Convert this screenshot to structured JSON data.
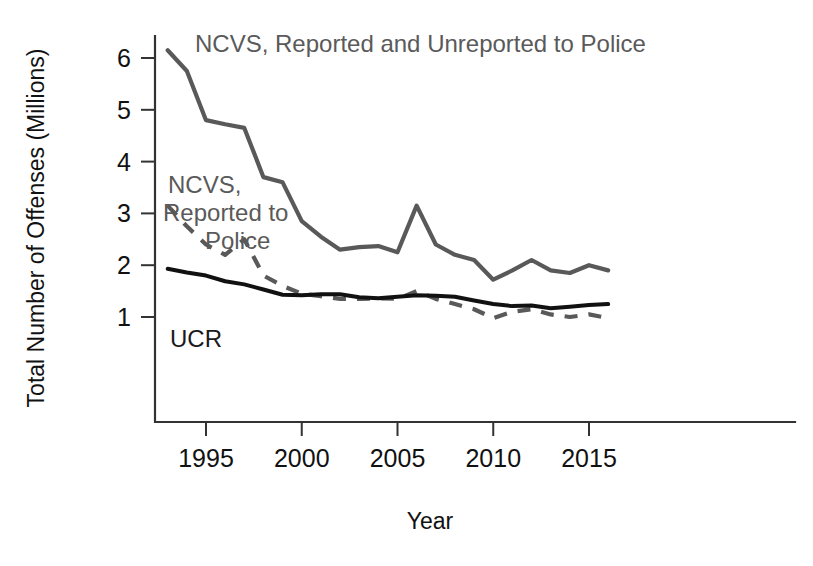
{
  "chart_data": {
    "type": "line",
    "title": "",
    "xlabel": "Year",
    "ylabel": "Total Number of Offenses (Millions)",
    "xlim": [
      1993,
      2016
    ],
    "ylim": [
      0,
      6.6
    ],
    "grid": false,
    "legend_position": "inline-annotations",
    "x_ticks": [
      "1995",
      "2000",
      "2005",
      "2010",
      "2015"
    ],
    "x_tick_values": [
      1995,
      2000,
      2005,
      2010,
      2015
    ],
    "y_ticks": [
      "1",
      "2",
      "3",
      "4",
      "5",
      "6"
    ],
    "y_tick_values": [
      1,
      2,
      3,
      4,
      5,
      6
    ],
    "x": [
      1993,
      1994,
      1995,
      1996,
      1997,
      1998,
      1999,
      2000,
      2001,
      2002,
      2003,
      2004,
      2005,
      2006,
      2007,
      2008,
      2009,
      2010,
      2011,
      2012,
      2013,
      2014,
      2015,
      2016
    ],
    "series": [
      {
        "name": "NCVS, Reported and Unreported to Police",
        "style": "solid",
        "color": "#595959",
        "values": [
          6.15,
          5.75,
          4.8,
          4.72,
          4.65,
          3.7,
          3.6,
          2.85,
          2.55,
          2.3,
          2.35,
          2.37,
          2.25,
          3.15,
          2.4,
          2.2,
          2.1,
          1.72,
          1.9,
          2.1,
          1.9,
          1.85,
          2.0,
          1.9
        ]
      },
      {
        "name": "NCVS, Reported to Police",
        "style": "dashed",
        "color": "#595959",
        "values": [
          3.15,
          2.75,
          2.4,
          2.2,
          2.5,
          1.8,
          1.6,
          1.45,
          1.4,
          1.35,
          1.35,
          1.36,
          1.35,
          1.5,
          1.35,
          1.25,
          1.15,
          0.98,
          1.1,
          1.15,
          1.05,
          1.0,
          1.05,
          0.98
        ]
      },
      {
        "name": "UCR",
        "style": "solid",
        "color": "#111111",
        "values": [
          1.93,
          1.86,
          1.8,
          1.69,
          1.63,
          1.53,
          1.43,
          1.42,
          1.44,
          1.44,
          1.38,
          1.36,
          1.39,
          1.42,
          1.41,
          1.39,
          1.32,
          1.25,
          1.21,
          1.22,
          1.17,
          1.2,
          1.23,
          1.25
        ]
      }
    ]
  },
  "annotations": [
    {
      "id": "label-ncvs-total",
      "text": "NCVS, Reported and Unreported to Police",
      "x": 195,
      "y": 52
    },
    {
      "id": "label-ncvs-reported-line1",
      "text": "NCVS,",
      "x": 168,
      "y": 193
    },
    {
      "id": "label-ncvs-reported-line2",
      "text": "Reported to",
      "x": 163,
      "y": 221
    },
    {
      "id": "label-ncvs-reported-line3",
      "text": "Police",
      "x": 205,
      "y": 249
    },
    {
      "id": "label-ucr",
      "text": "UCR",
      "x": 170,
      "y": 347
    }
  ],
  "axes": {
    "y_title": "Total Number of Offenses (Millions)",
    "x_title": "Year"
  },
  "colors": {
    "ncvs_total": "#595959",
    "ncvs_reported": "#595959",
    "ucr": "#111111",
    "axis": "#333333",
    "background": "#ffffff"
  }
}
